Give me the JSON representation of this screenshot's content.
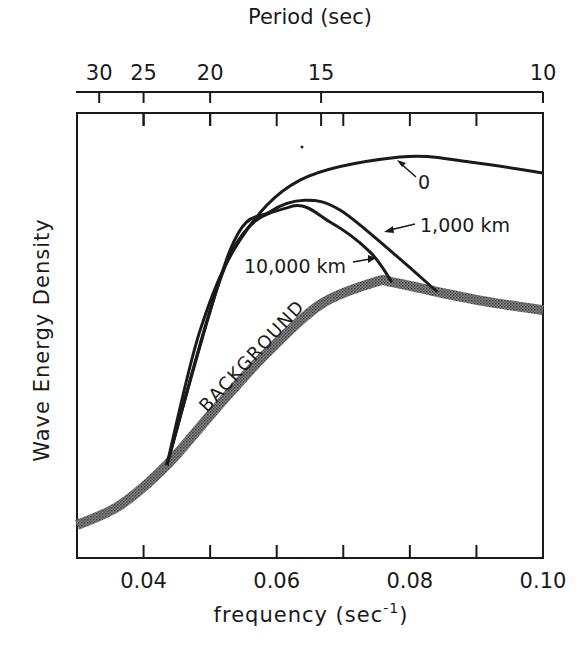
{
  "chart_data": {
    "type": "line",
    "title": "",
    "xlabel": "frequency (sec⁻¹)",
    "xlabel_main": "frequency  (sec",
    "xlabel_sup": "-1",
    "xlabel_close": ")",
    "ylabel": "Wave Energy Density",
    "top_axis_label": "Period  (sec)",
    "xlim": [
      0.03,
      0.1
    ],
    "ylim": [
      0,
      100
    ],
    "y_units": "arbitrary (no tick labels)",
    "grid": false,
    "legend": "inline labels",
    "x_ticks": [
      0.04,
      0.05,
      0.06,
      0.07,
      0.08,
      0.09,
      0.1
    ],
    "x_tick_labels": [
      {
        "value": 0.04,
        "label": "0.04"
      },
      {
        "value": 0.06,
        "label": "0.06"
      },
      {
        "value": 0.08,
        "label": "0.08"
      },
      {
        "value": 0.1,
        "label": "0.10"
      }
    ],
    "top_ticks": [
      {
        "period": 30,
        "label": "30"
      },
      {
        "period": 25,
        "label": "25"
      },
      {
        "period": 20,
        "label": "20"
      },
      {
        "period": 15,
        "label": "15"
      },
      {
        "period": 10,
        "label": "10"
      }
    ],
    "series": [
      {
        "name": "BACKGROUND",
        "style": "thick stippled gray",
        "x": [
          0.03,
          0.0365,
          0.0435,
          0.0507,
          0.0582,
          0.0665,
          0.0748,
          0.0773,
          0.0841,
          0.092,
          0.1
        ],
        "values": [
          7.4,
          11.9,
          20.9,
          33.3,
          45.6,
          56.9,
          62.0,
          62.0,
          59.8,
          57.5,
          55.7
        ]
      },
      {
        "name": "0",
        "style": "solid black",
        "x": [
          0.0435,
          0.0485,
          0.0545,
          0.0635,
          0.0785,
          0.089,
          0.1
        ],
        "values": [
          20.9,
          51.2,
          71.5,
          84.9,
          90.1,
          89.0,
          86.5
        ]
      },
      {
        "name": "1,000 km",
        "style": "solid black",
        "x": [
          0.0435,
          0.053,
          0.059,
          0.0642,
          0.0695,
          0.0778,
          0.0841
        ],
        "values": [
          20.9,
          69.2,
          77.8,
          80.4,
          78.2,
          68.1,
          59.8
        ]
      },
      {
        "name": "10,000 km",
        "style": "solid black",
        "x": [
          0.0435,
          0.053,
          0.062,
          0.068,
          0.074,
          0.0773
        ],
        "values": [
          20.9,
          68.1,
          78.9,
          75.5,
          68.8,
          62.0
        ]
      }
    ],
    "annotations": [
      {
        "text": "0",
        "points_to": "0 curve near 0.078"
      },
      {
        "text": "1,000 km",
        "points_to": "1,000 km curve near 0.074"
      },
      {
        "text": "10,000 km",
        "points_to": "10,000 km curve near 0.074"
      },
      {
        "text": "BACKGROUND",
        "along": "background curve"
      }
    ]
  }
}
